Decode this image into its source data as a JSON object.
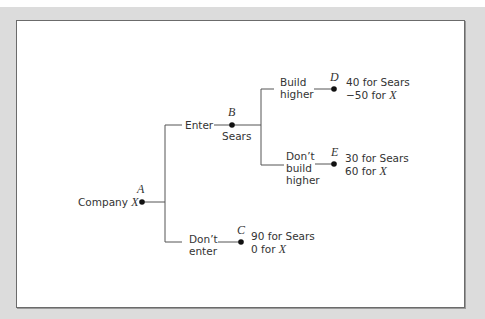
{
  "diagram": {
    "type": "game-tree",
    "root": {
      "label": "Company",
      "player_var": "X",
      "node": "A"
    },
    "branches": {
      "enter": {
        "label": "Enter",
        "node": "B",
        "node_player": "Sears",
        "sub_branches": {
          "build_higher": {
            "label_line1": "Build",
            "label_line2": "higher",
            "node": "D",
            "payoff_sears": "40 for Sears",
            "payoff_x_value": "−50 for ",
            "payoff_x_var": "X"
          },
          "dont_build_higher": {
            "label_line1": "Don’t",
            "label_line2": "build",
            "label_line3": "higher",
            "node": "E",
            "payoff_sears": "30 for Sears",
            "payoff_x_value": "60 for ",
            "payoff_x_var": "X"
          }
        }
      },
      "dont_enter": {
        "label_line1": "Don’t",
        "label_line2": "enter",
        "node": "C",
        "payoff_sears": "90 for Sears",
        "payoff_x_value": "0 for ",
        "payoff_x_var": "X"
      }
    },
    "colors": {
      "frame": "#dcdcdc",
      "border": "#6b6b6b",
      "line": "#555555",
      "text": "#333333"
    }
  }
}
